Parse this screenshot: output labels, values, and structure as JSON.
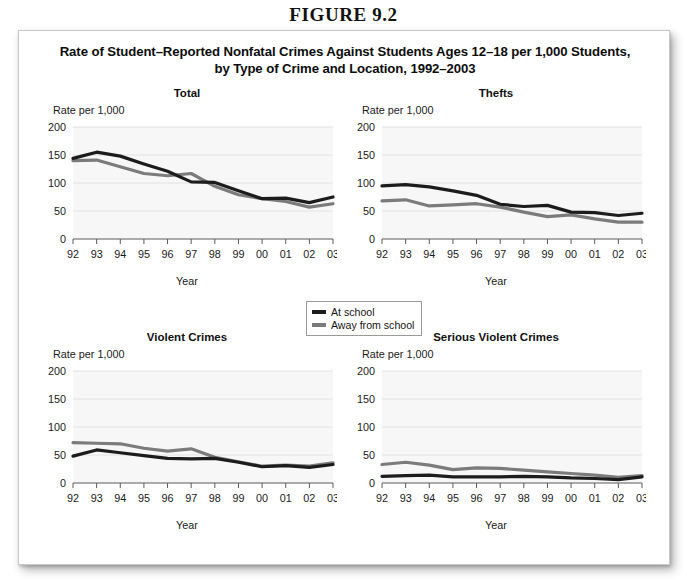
{
  "figure_number": "FIGURE 9.2",
  "chart_title_line1": "Rate of Student–Reported Nonfatal Crimes Against Students Ages 12–18 per 1,000 Students,",
  "chart_title_line2": "by Type of Crime and Location, 1992–2003",
  "legend": {
    "items": [
      {
        "label": "At school",
        "color": "#1c1c1c"
      },
      {
        "label": "Away from school",
        "color": "#7b7b7b"
      }
    ]
  },
  "axis": {
    "y_label": "Rate per 1,000",
    "x_label": "Year",
    "y_ticks": [
      "200",
      "150",
      "100",
      "50",
      "0"
    ],
    "x_ticks": [
      "92",
      "93",
      "94",
      "95",
      "96",
      "97",
      "98",
      "99",
      "00",
      "01",
      "02",
      "03"
    ]
  },
  "colors": {
    "at_school": "#1c1c1c",
    "away_from_school": "#7b7b7b",
    "plot_background": "#f7f7f7",
    "gridline": "#e2e2e2",
    "axis": "#5a5a5a",
    "card_background": "#ffffff",
    "page_background": "#ffffff"
  },
  "chart_data": [
    {
      "type": "line",
      "title": "Total",
      "xlabel": "Year",
      "ylabel": "Rate per 1,000",
      "ylim": [
        0,
        200
      ],
      "grid": true,
      "legend_position": "below-center-shared",
      "categories": [
        "92",
        "93",
        "94",
        "95",
        "96",
        "97",
        "98",
        "99",
        "00",
        "01",
        "02",
        "03"
      ],
      "series": [
        {
          "name": "At school",
          "values": [
            144,
            155,
            148,
            134,
            121,
            102,
            101,
            86,
            72,
            73,
            65,
            75
          ]
        },
        {
          "name": "Away from school",
          "values": [
            140,
            141,
            129,
            117,
            113,
            117,
            94,
            79,
            72,
            67,
            57,
            63
          ]
        }
      ]
    },
    {
      "type": "line",
      "title": "Thefts",
      "xlabel": "Year",
      "ylabel": "Rate per 1,000",
      "ylim": [
        0,
        200
      ],
      "grid": true,
      "legend_position": "below-center-shared",
      "categories": [
        "92",
        "93",
        "94",
        "95",
        "96",
        "97",
        "98",
        "99",
        "00",
        "01",
        "02",
        "03"
      ],
      "series": [
        {
          "name": "At school",
          "values": [
            95,
            97,
            93,
            86,
            78,
            62,
            58,
            60,
            48,
            47,
            42,
            46
          ]
        },
        {
          "name": "Away from school",
          "values": [
            68,
            70,
            59,
            61,
            63,
            57,
            48,
            40,
            43,
            36,
            30,
            30
          ]
        }
      ]
    },
    {
      "type": "line",
      "title": "Violent Crimes",
      "xlabel": "Year",
      "ylabel": "Rate per 1,000",
      "ylim": [
        0,
        200
      ],
      "grid": true,
      "legend_position": "below-center-shared",
      "categories": [
        "92",
        "93",
        "94",
        "95",
        "96",
        "97",
        "98",
        "99",
        "00",
        "01",
        "02",
        "03"
      ],
      "series": [
        {
          "name": "At school",
          "values": [
            48,
            59,
            54,
            49,
            44,
            43,
            44,
            37,
            29,
            31,
            28,
            33
          ]
        },
        {
          "name": "Away from school",
          "values": [
            72,
            71,
            70,
            62,
            57,
            61,
            46,
            38,
            30,
            32,
            30,
            36
          ]
        }
      ]
    },
    {
      "type": "line",
      "title": "Serious Violent Crimes",
      "xlabel": "Year",
      "ylabel": "Rate per 1,000",
      "ylim": [
        0,
        200
      ],
      "grid": true,
      "legend_position": "below-center-shared",
      "categories": [
        "92",
        "93",
        "94",
        "95",
        "96",
        "97",
        "98",
        "99",
        "00",
        "01",
        "02",
        "03"
      ],
      "series": [
        {
          "name": "At school",
          "values": [
            12,
            13,
            14,
            11,
            11,
            11,
            12,
            11,
            9,
            8,
            6,
            11
          ]
        },
        {
          "name": "Away from school",
          "values": [
            33,
            37,
            32,
            24,
            27,
            26,
            23,
            20,
            17,
            14,
            10,
            13
          ]
        }
      ]
    }
  ]
}
